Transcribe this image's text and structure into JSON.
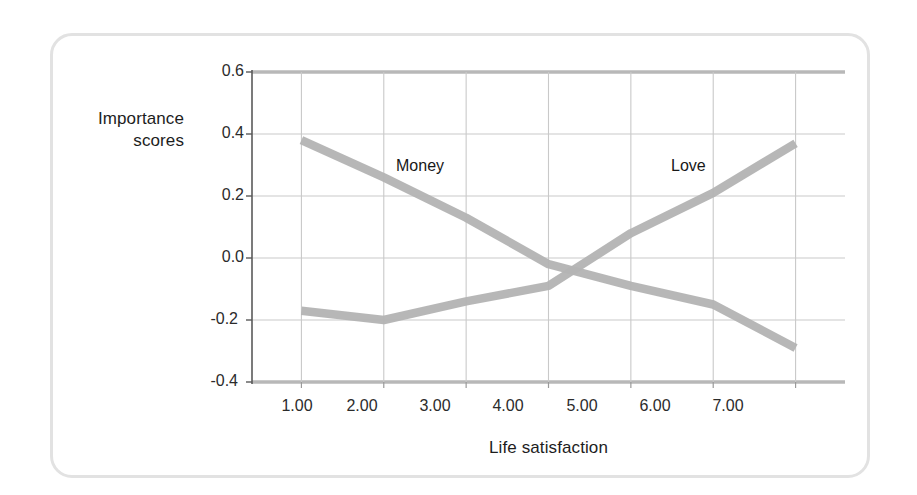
{
  "chart_data": {
    "type": "line",
    "title": "",
    "xlabel": "Life satisfaction",
    "ylabel": "Importance scores",
    "ylabel_line1": "Importance",
    "ylabel_line2": "scores",
    "x": [
      1.0,
      2.0,
      3.0,
      4.0,
      5.0,
      6.0,
      7.0
    ],
    "xtick_labels": [
      "1.00",
      "2.00",
      "3.00",
      "4.00",
      "5.00",
      "6.00",
      "7.00"
    ],
    "ytick_labels": [
      "0.6",
      "0.4",
      "0.2",
      "0.0",
      "-0.2",
      "-0.4"
    ],
    "yticks": [
      0.6,
      0.4,
      0.2,
      0.0,
      -0.2,
      -0.4
    ],
    "xlim": [
      0.4,
      7.6
    ],
    "ylim": [
      -0.4,
      0.6
    ],
    "grid": true,
    "legend_position": "inline-annotations",
    "line_color": "#b3b3b3",
    "grid_color": "#c9c9c9",
    "axis_color": "#808080",
    "series": [
      {
        "name": "Money",
        "label": "Money",
        "values": [
          0.38,
          0.26,
          0.13,
          -0.02,
          -0.09,
          -0.15,
          -0.29
        ],
        "annotation": "Money"
      },
      {
        "name": "Love",
        "label": "Love",
        "values": [
          -0.17,
          -0.2,
          -0.14,
          -0.09,
          0.08,
          0.21,
          0.37
        ],
        "annotation": "Love"
      }
    ]
  }
}
